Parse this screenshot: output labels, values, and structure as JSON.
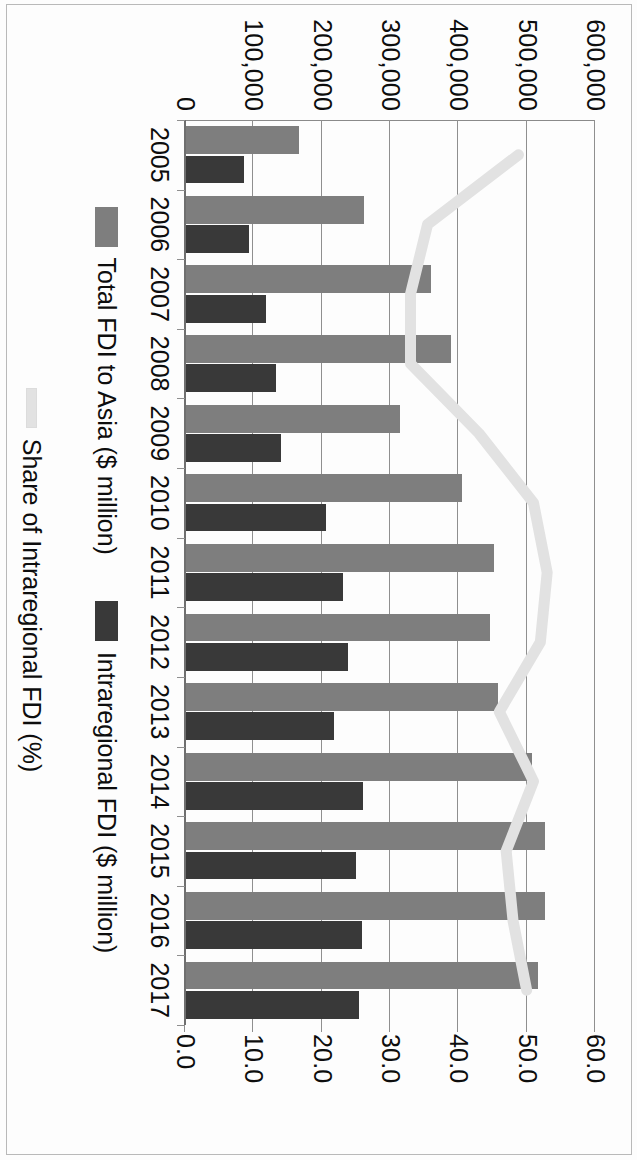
{
  "chart_data": {
    "type": "bar",
    "title": "",
    "subtitle": "",
    "xlabel": "",
    "ylabel": "",
    "y2label": "",
    "grid": true,
    "legend_position": "bottom",
    "orientation": "rotated-90-clockwise",
    "categories": [
      "2005",
      "2006",
      "2007",
      "2008",
      "2009",
      "2010",
      "2011",
      "2012",
      "2013",
      "2014",
      "2015",
      "2016",
      "2017"
    ],
    "ylim": [
      0,
      600000
    ],
    "yticks": [
      0,
      100000,
      200000,
      300000,
      400000,
      500000,
      600000
    ],
    "ytick_labels": [
      "0",
      "100,000",
      "200,000",
      "300,000",
      "400,000",
      "500,000",
      "600,000"
    ],
    "y2lim": [
      0,
      60
    ],
    "y2ticks": [
      0,
      10,
      20,
      30,
      40,
      50,
      60
    ],
    "y2tick_labels": [
      "0.0",
      "10.0",
      "20.0",
      "30.0",
      "40.0",
      "50.0",
      "60.0"
    ],
    "series": [
      {
        "name": "Total FDI to Asia ($ million)",
        "type": "bar",
        "axis": "primary",
        "color": "#7e7e7e",
        "values": [
          167000,
          262000,
          360000,
          390000,
          314000,
          405000,
          452000,
          447000,
          458000,
          508000,
          527000,
          527000,
          517000
        ]
      },
      {
        "name": "Intraregional FDI ($ million)",
        "type": "bar",
        "axis": "primary",
        "color": "#393939",
        "values": [
          86000,
          93000,
          119000,
          133000,
          140000,
          207000,
          231000,
          238000,
          218000,
          260000,
          250000,
          259000,
          255000
        ]
      },
      {
        "name": "Share of Intraregional FDI (%)",
        "type": "line",
        "axis": "secondary",
        "color": "#e2e2e2",
        "values": [
          48.8,
          35.5,
          33.0,
          33.0,
          43.0,
          51.0,
          53.0,
          52.0,
          46.0,
          51.0,
          47.0,
          48.0,
          50.0
        ]
      }
    ]
  },
  "legend": {
    "items": [
      {
        "label": "Total FDI to Asia ($ million)",
        "swatch": "total"
      },
      {
        "label": "Intraregional FDI ($ million)",
        "swatch": "intra"
      },
      {
        "label": "Share of Intraregional FDI (%)",
        "swatch": "share"
      }
    ]
  }
}
